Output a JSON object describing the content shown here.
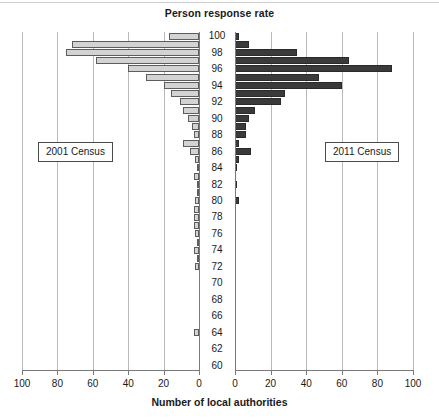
{
  "chart_data": {
    "type": "bar",
    "orientation": "horizontal",
    "layout": "back-to-back-pyramid",
    "title": "Person response rate",
    "xlabel": "Number of local authorities",
    "ylabel": "Person response rate",
    "grid": true,
    "legend_position": "inside-panels",
    "categories": [
      100,
      99,
      98,
      97,
      96,
      95,
      94,
      93,
      92,
      91,
      90,
      89,
      88,
      87,
      86,
      85,
      84,
      83,
      82,
      81,
      80,
      79,
      78,
      77,
      76,
      75,
      74,
      73,
      72,
      71,
      70,
      69,
      68,
      67,
      66,
      65,
      64,
      63,
      62,
      61,
      60
    ],
    "y_tick_labels": [
      "100",
      "98",
      "96",
      "94",
      "92",
      "90",
      "88",
      "86",
      "84",
      "82",
      "80",
      "78",
      "76",
      "74",
      "72",
      "70",
      "68",
      "66",
      "64",
      "62",
      "60"
    ],
    "ylim": [
      60,
      100
    ],
    "xlim_left": [
      100,
      0
    ],
    "xlim_right": [
      0,
      100
    ],
    "x_tick_labels_left": [
      "100",
      "80",
      "60",
      "40",
      "20",
      "0"
    ],
    "x_tick_labels_right": [
      "0",
      "20",
      "40",
      "60",
      "80",
      "100"
    ],
    "series": [
      {
        "name": "2001 Census",
        "side": "left",
        "color": "#d3d3d3",
        "values": [
          17,
          72,
          75,
          58,
          40,
          30,
          20,
          16,
          11,
          9,
          6,
          4,
          3,
          9,
          5,
          2,
          1,
          3,
          1,
          1,
          2,
          3,
          3,
          3,
          2,
          1,
          3,
          1,
          2,
          0,
          0,
          0,
          0,
          0,
          0,
          0,
          3,
          0,
          0,
          0,
          0
        ]
      },
      {
        "name": "2011 Census",
        "side": "right",
        "color": "#3a3a3a",
        "values": [
          2,
          8,
          35,
          64,
          88,
          47,
          60,
          28,
          26,
          11,
          8,
          6,
          6,
          2,
          9,
          2,
          1,
          0,
          1,
          0,
          2,
          0,
          0,
          0,
          0,
          0,
          0,
          0,
          0,
          0,
          0,
          0,
          0,
          0,
          0,
          0,
          0,
          0,
          0,
          0,
          0
        ]
      }
    ]
  },
  "legends": {
    "left": "2001 Census",
    "right": "2011 Census"
  }
}
